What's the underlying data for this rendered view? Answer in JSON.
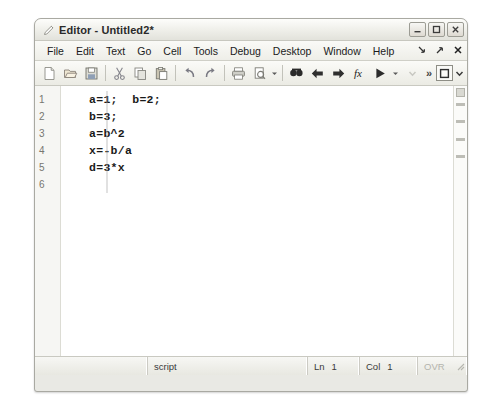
{
  "window": {
    "title": "Editor - Untitled2*",
    "icon": "pencil-editor-icon",
    "controls": [
      {
        "name": "minimize-button",
        "glyph": "minimize"
      },
      {
        "name": "maximize-button",
        "glyph": "maximize"
      },
      {
        "name": "close-button",
        "glyph": "close"
      }
    ]
  },
  "menubar": {
    "items": [
      {
        "label": "File"
      },
      {
        "label": "Edit"
      },
      {
        "label": "Text"
      },
      {
        "label": "Go"
      },
      {
        "label": "Cell"
      },
      {
        "label": "Tools"
      },
      {
        "label": "Debug"
      },
      {
        "label": "Desktop"
      },
      {
        "label": "Window"
      },
      {
        "label": "Help"
      }
    ],
    "mdi_controls": [
      {
        "name": "mdi-restore-button",
        "glyph": "arrow-down-right"
      },
      {
        "name": "mdi-undock-button",
        "glyph": "arrow-up-right"
      },
      {
        "name": "mdi-close-button",
        "glyph": "x"
      }
    ]
  },
  "toolbar": {
    "groups": [
      {
        "buttons": [
          {
            "name": "new-file-icon",
            "tip": "New"
          },
          {
            "name": "open-file-icon",
            "tip": "Open"
          },
          {
            "name": "save-file-icon",
            "tip": "Save"
          }
        ]
      },
      {
        "buttons": [
          {
            "name": "cut-icon",
            "tip": "Cut"
          },
          {
            "name": "copy-icon",
            "tip": "Copy"
          },
          {
            "name": "paste-icon",
            "tip": "Paste"
          }
        ]
      },
      {
        "buttons": [
          {
            "name": "undo-icon",
            "tip": "Undo"
          },
          {
            "name": "redo-icon",
            "tip": "Redo"
          }
        ]
      },
      {
        "buttons": [
          {
            "name": "print-icon",
            "tip": "Print"
          },
          {
            "name": "print-preview-icon",
            "tip": "Print Preview"
          }
        ],
        "caret": true
      },
      {
        "buttons": [
          {
            "name": "find-icon",
            "tip": "Find"
          },
          {
            "name": "back-arrow-icon",
            "tip": "Back"
          },
          {
            "name": "forward-arrow-icon",
            "tip": "Forward"
          },
          {
            "name": "function-browser-icon",
            "tip": "Function Browser"
          },
          {
            "name": "run-icon",
            "tip": "Run"
          }
        ],
        "caret": true
      }
    ],
    "overflow_label": "»",
    "dock_button": {
      "name": "dock-window-icon"
    },
    "dock_caret": {
      "name": "dock-chevron-down-icon"
    },
    "disabled_caret": {
      "name": "disabled-chevron-down-icon"
    }
  },
  "editor": {
    "line_numbers": [
      "1",
      "2",
      "3",
      "4",
      "5",
      "6"
    ],
    "lines": [
      "a=1;  b=2;",
      "b=3;",
      "a=b^2",
      "x=-b/a",
      "d=3*x",
      ""
    ],
    "analyzer_strip": {
      "name": "code-analyzer-strip",
      "summary_box": "code-analyzer-summary-box",
      "marks": 4
    }
  },
  "statusbar": {
    "file_type": "script",
    "line_label": "Ln",
    "line_value": "1",
    "col_label": "Col",
    "col_value": "1",
    "overwrite_label": "OVR"
  }
}
